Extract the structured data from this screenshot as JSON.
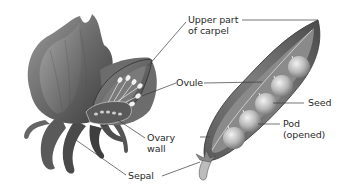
{
  "diagram": {
    "background": "#ffffff",
    "colors": {
      "line": "#3a3a3a",
      "text": "#2a2a2a",
      "petal_dark": "#4a4a4a",
      "petal_light": "#bdbdbd",
      "seed_light": "#e6e6e6",
      "seed_dark": "#8a8a8a",
      "pod": "#6e6e6e"
    },
    "labels": {
      "upper_carpel": {
        "line1": "Upper part",
        "line2": "of carpel"
      },
      "ovule": {
        "line1": "Ovule"
      },
      "seed": {
        "line1": "Seed"
      },
      "pod": {
        "line1": "Pod",
        "line2": "(opened)"
      },
      "ovary_wall": {
        "line1": "Ovary",
        "line2": "wall"
      },
      "sepal": {
        "line1": "Sepal"
      }
    },
    "parts": {
      "flower": "flower-cutaway",
      "pod": "opened-pea-pod",
      "seed_count": 5
    }
  }
}
